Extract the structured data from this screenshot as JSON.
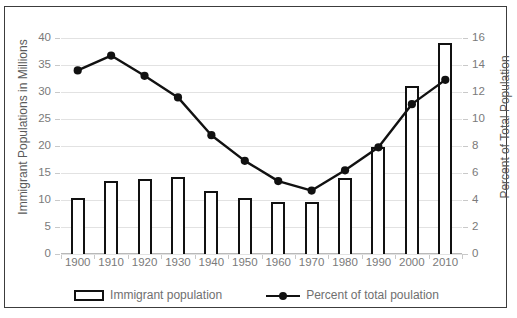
{
  "chart_data": {
    "type": "bar",
    "title": "",
    "subtitle": "",
    "xlabel": "",
    "ylabel": "Immigrant Populations in Millions",
    "y2label": "Percent of Total Population",
    "categories": [
      "1900",
      "1910",
      "1920",
      "1930",
      "1940",
      "1950",
      "1960",
      "1970",
      "1980",
      "1990",
      "2000",
      "2010"
    ],
    "ylim": [
      0,
      40
    ],
    "y2lim": [
      0,
      16
    ],
    "yticks": [
      0,
      5,
      10,
      15,
      20,
      25,
      30,
      35,
      40
    ],
    "y2ticks": [
      0,
      2,
      4,
      6,
      8,
      10,
      12,
      14,
      16
    ],
    "grid": true,
    "legend_position": "bottom",
    "series": [
      {
        "name": "Immigrant population",
        "kind": "bar",
        "axis": "left",
        "units": "millions",
        "values": [
          10.3,
          13.5,
          13.9,
          14.2,
          11.6,
          10.3,
          9.7,
          9.6,
          14.1,
          19.8,
          31.1,
          39.0
        ]
      },
      {
        "name": "Percent of total poulation",
        "kind": "line",
        "axis": "right",
        "units": "percent",
        "values": [
          13.6,
          14.7,
          13.2,
          11.6,
          8.8,
          6.9,
          5.4,
          4.7,
          6.2,
          7.9,
          11.1,
          12.9
        ]
      }
    ]
  },
  "legend": {
    "bar_label": "Immigrant population",
    "line_label": "Percent of total poulation"
  },
  "axes": {
    "left_title": "Immigrant Populations in Millions",
    "right_title": "Percent of Total Population"
  },
  "colors": {
    "series_bar": "#111111",
    "series_line": "#111111",
    "grid": "#e2e2e2",
    "tick_text": "#7a7a7a",
    "border": "#3c3c3c",
    "background": "#ffffff"
  }
}
